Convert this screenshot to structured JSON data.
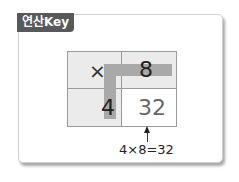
{
  "tab": {
    "label": "연산Key"
  },
  "grid": {
    "operator": "×",
    "top_right": "8",
    "bottom_left": "4",
    "result": "32"
  },
  "equation": "4×8=32",
  "colors": {
    "tab_bg": "#58595b",
    "shaded_cell": "#ebebeb",
    "highlight_bar": "#a9a9a9"
  }
}
